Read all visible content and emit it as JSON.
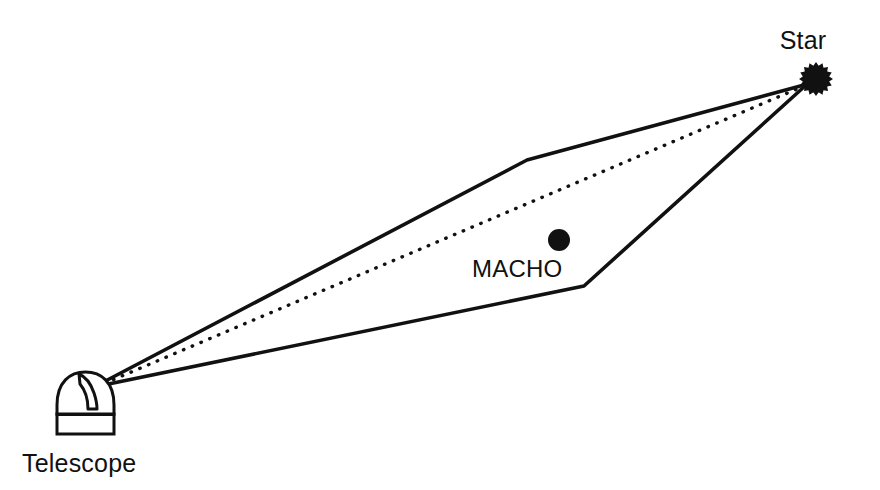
{
  "figure": {
    "background_color": "#ffffff",
    "stroke_color": "#111111",
    "width": 880,
    "height": 490
  },
  "labels": {
    "star": "Star",
    "macho": "MACHO",
    "telescope": "Telescope"
  },
  "objects": {
    "star": {
      "name": "Star",
      "shape": "spiky-star-burst",
      "center": {
        "x": 816,
        "y": 79
      },
      "radius": 17,
      "spikes": 16,
      "fill": "#111111"
    },
    "macho": {
      "name": "MACHO",
      "shape": "filled-circle",
      "center": {
        "x": 559,
        "y": 240
      },
      "radius": 11,
      "fill": "#111111"
    },
    "telescope": {
      "name": "Telescope observatory dome",
      "shape": "dome-with-slit",
      "apex": {
        "x": 93,
        "y": 387
      },
      "base": {
        "x": 57,
        "y": 413,
        "width": 57,
        "height": 20
      },
      "fill": "#ffffff",
      "stroke": "#111111"
    }
  },
  "paths": {
    "light_path_upper": {
      "name": "deflected light ray (upper)",
      "style": "solid",
      "stroke_width": 3.6,
      "points": [
        {
          "x": 94,
          "y": 387
        },
        {
          "x": 527,
          "y": 160
        },
        {
          "x": 804,
          "y": 85
        }
      ]
    },
    "light_path_lower": {
      "name": "deflected light ray (lower)",
      "style": "solid",
      "stroke_width": 3.6,
      "points": [
        {
          "x": 94,
          "y": 387
        },
        {
          "x": 584,
          "y": 286
        },
        {
          "x": 805,
          "y": 86
        }
      ]
    },
    "line_of_sight": {
      "name": "direct line of sight",
      "style": "dotted",
      "stroke_width": 3.4,
      "dash": "0.5 9",
      "points": [
        {
          "x": 96,
          "y": 387
        },
        {
          "x": 804,
          "y": 86
        }
      ]
    }
  },
  "label_positions": {
    "star": {
      "x": 803,
      "y": 49,
      "anchor": "middle"
    },
    "macho": {
      "x": 472,
      "y": 277,
      "anchor": "start"
    },
    "telescope": {
      "x": 22,
      "y": 472,
      "anchor": "start"
    }
  }
}
